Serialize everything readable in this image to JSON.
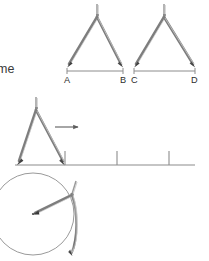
{
  "figure": {
    "background_color": "#ffffff",
    "ink_color": "#808080",
    "dark_ink_color": "#4a4a4a",
    "text_color": "#3a3a3a",
    "width": 209,
    "height": 261
  },
  "body_text": {
    "fragment": "me"
  },
  "panel_top": {
    "name": "two-compasses-over-segments",
    "compass_left": {
      "label": "compass-measuring-AB",
      "hinge_x": 97,
      "hinge_y": 17,
      "handle_top_y": 4,
      "point_left_x": 68,
      "point_left_y": 67,
      "point_right_x": 122,
      "point_right_y": 67
    },
    "compass_right": {
      "label": "compass-measuring-CD",
      "hinge_x": 164,
      "hinge_y": 17,
      "handle_top_y": 4,
      "point_left_x": 135,
      "point_left_y": 67,
      "point_right_x": 194,
      "point_right_y": 67
    },
    "segments": [
      {
        "name": "segment-AB",
        "start_label": "A",
        "end_label": "B",
        "x1": 67,
        "x2": 123,
        "y": 71
      },
      {
        "name": "segment-CD",
        "start_label": "C",
        "end_label": "D",
        "x1": 134,
        "x2": 195,
        "y": 71
      }
    ],
    "labels": [
      {
        "text": "A",
        "x": 67,
        "y": 81
      },
      {
        "text": "B",
        "x": 120,
        "y": 81
      },
      {
        "text": "C",
        "x": 134,
        "y": 81
      },
      {
        "text": "D",
        "x": 191,
        "y": 81
      }
    ]
  },
  "panel_middle": {
    "name": "compass-stepping-on-number-line",
    "compass": {
      "label": "compass-on-number-line",
      "hinge_x": 36,
      "hinge_y": 109,
      "handle_top_y": 97,
      "point_left_x": 17,
      "point_left_y": 164,
      "point_right_x": 64,
      "point_right_y": 164
    },
    "arrow": {
      "name": "step-direction-arrow",
      "x1": 55,
      "x2": 80,
      "y": 127,
      "direction": "right"
    },
    "number_line": {
      "name": "number-line",
      "x1": 15,
      "x2": 195,
      "y": 165,
      "tick_height": 14,
      "ticks": [
        65,
        117,
        169
      ]
    }
  },
  "panel_bottom": {
    "name": "compass-drawing-circle",
    "circle": {
      "name": "drawn-circle",
      "cx": 33,
      "cy": 214,
      "r": 41
    },
    "center_dot": {
      "name": "circle-center-point",
      "cx": 33,
      "cy": 214,
      "r": 1.1
    },
    "compass": {
      "label": "compass-drawing",
      "hinge_x": 72,
      "hinge_y": 193,
      "handle_top_y": 181,
      "pivot_x": 33,
      "pivot_y": 214,
      "pencil_x": 72,
      "pencil_y": 255
    }
  }
}
